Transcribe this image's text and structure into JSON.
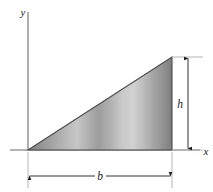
{
  "figure": {
    "axes": {
      "y_label": "y",
      "x_label": "x",
      "origin_x": 28,
      "origin_y": 150,
      "y_axis_top": 12,
      "x_axis_left": 10,
      "x_axis_right": 200,
      "color": "#9a9a9a",
      "width": 1.6
    },
    "shape": {
      "type": "right-triangle",
      "vertices": [
        {
          "name": "origin-vertex",
          "x": 28,
          "y": 150
        },
        {
          "name": "bottom-right-vertex",
          "x": 172,
          "y": 150
        },
        {
          "name": "apex-vertex",
          "x": 172,
          "y": 57
        }
      ],
      "base_px": 144,
      "height_px": 93,
      "outline_color": "#4a4a4a",
      "outline_width": 1.2,
      "fill_stops": [
        {
          "offset": 0.0,
          "color": "#838383"
        },
        {
          "offset": 0.07,
          "color": "#909090"
        },
        {
          "offset": 0.16,
          "color": "#a3a3a3"
        },
        {
          "offset": 0.26,
          "color": "#b7b7b7"
        },
        {
          "offset": 0.34,
          "color": "#c6c6c6"
        },
        {
          "offset": 0.41,
          "color": "#b2b2b2"
        },
        {
          "offset": 0.49,
          "color": "#9d9d9d"
        },
        {
          "offset": 0.57,
          "color": "#b0b0b0"
        },
        {
          "offset": 0.65,
          "color": "#c8c8c8"
        },
        {
          "offset": 0.73,
          "color": "#d2d2d2"
        },
        {
          "offset": 0.8,
          "color": "#bdbdbd"
        },
        {
          "offset": 0.88,
          "color": "#a2a2a2"
        },
        {
          "offset": 0.95,
          "color": "#8e8e8e"
        },
        {
          "offset": 1.0,
          "color": "#7d7d7d"
        }
      ]
    },
    "dimensions": [
      {
        "name": "height-dimension",
        "label": "h",
        "orientation": "vertical",
        "line_x": 188,
        "line_y1": 57,
        "line_y2": 150,
        "label_x": 184,
        "label_y": 108,
        "extension_lines": [
          {
            "x1": 172,
            "y1": 57,
            "x2": 202,
            "y2": 57
          },
          {
            "x1": 172,
            "y1": 150,
            "x2": 202,
            "y2": 150
          }
        ],
        "color": "#1a1a1a"
      },
      {
        "name": "base-dimension",
        "label": "b",
        "orientation": "horizontal",
        "line_y": 176,
        "line_x1": 28,
        "line_x2": 172,
        "label_x": 100,
        "label_y": 180,
        "extension_lines": [
          {
            "x1": 28,
            "y1": 150,
            "x2": 28,
            "y2": 188
          },
          {
            "x1": 172,
            "y1": 150,
            "x2": 172,
            "y2": 188
          }
        ],
        "color": "#1a1a1a"
      }
    ],
    "colors": {
      "background": "#ffffff",
      "axis": "#9a9a9a",
      "dimension": "#1a1a1a",
      "outline": "#4a4a4a",
      "extension": "#b0b0b0"
    }
  }
}
